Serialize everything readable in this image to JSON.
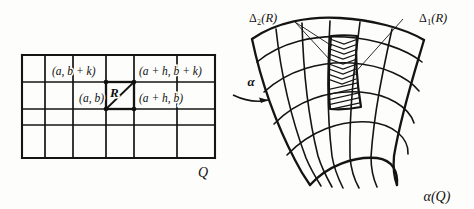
{
  "figure": {
    "background_color": "#fdfdfb",
    "ink_color": "#141414"
  },
  "left_panel": {
    "name": "rectangular-grid-domain",
    "domain_label": "Q",
    "subrectangle_label": "R",
    "grid": {
      "columns": 6,
      "rows": 4,
      "x_lines": [
        22,
        45,
        73,
        106,
        134,
        177,
        215
      ],
      "y_lines": [
        55,
        82,
        109,
        125,
        158
      ]
    },
    "corner_labels": [
      {
        "id": "lower-left",
        "text": "(a, b)",
        "x": 104,
        "y": 101,
        "anchor": "end"
      },
      {
        "id": "upper-left",
        "text": "(a, b + k)",
        "x": 52,
        "y": 74,
        "anchor": "start"
      },
      {
        "id": "lower-right",
        "text": "(a + h, b)",
        "x": 138,
        "y": 101,
        "anchor": "start"
      },
      {
        "id": "upper-right",
        "text": "(a + h, b + k)",
        "x": 138,
        "y": 74,
        "anchor": "start"
      }
    ],
    "corner_dots": [
      {
        "x": 106,
        "y": 109
      },
      {
        "x": 134,
        "y": 109
      },
      {
        "x": 106,
        "y": 82
      },
      {
        "x": 134,
        "y": 82
      }
    ],
    "subrectangle": {
      "x": 106,
      "y": 82,
      "width": 28,
      "height": 27
    }
  },
  "map_arrow": {
    "name": "alpha-map-arrow",
    "label": "α"
  },
  "right_panel": {
    "name": "curved-surface-image",
    "image_label": "α(Q)",
    "annotations": [
      {
        "id": "delta-2",
        "symbol": "Δ",
        "subscript": "2",
        "argument": "(R)",
        "text": "Δ₂(R)"
      },
      {
        "id": "delta-1",
        "symbol": "Δ",
        "subscript": "1",
        "argument": "(R)",
        "text": "Δ₁(R)"
      }
    ],
    "hatched_region": {
      "name": "image-of-R-hatched",
      "upper_pattern": "chevron",
      "lower_pattern": "diagonal"
    },
    "grid": {
      "u_curves": 7,
      "v_curves": 5
    }
  }
}
